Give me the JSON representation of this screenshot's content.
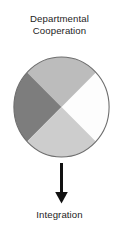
{
  "figure": {
    "title": {
      "line1": "Departmental",
      "line2": "Cooperation"
    },
    "caption": "Integration",
    "arrow": {
      "direction": "down",
      "color": "#111111"
    },
    "diagram": {
      "type": "quartered-circle",
      "outline_color": "#6e6e6e",
      "segments": [
        {
          "position": "top",
          "label": "",
          "color": "#bcbcbc"
        },
        {
          "position": "left",
          "label": "",
          "color": "#7d7d7d"
        },
        {
          "position": "bottom",
          "label": "",
          "color": "#cdcdcd"
        },
        {
          "position": "right",
          "label": "",
          "color": "#fdfdfd"
        }
      ]
    }
  }
}
